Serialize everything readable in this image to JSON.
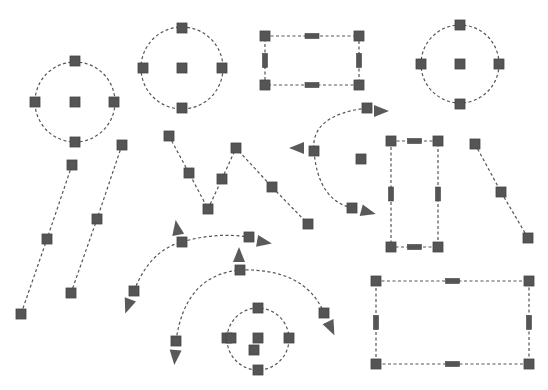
{
  "canvas": {
    "width": 548,
    "height": 390,
    "background": "#ffffff"
  },
  "colors": {
    "stroke": "#555555",
    "handle": "#555555",
    "arrow": "#5a5a5a"
  },
  "handle_size": 10,
  "circles": [
    {
      "id": "circle-left",
      "cx": 75,
      "cy": 102,
      "r": 40,
      "handles": [
        [
          75,
          61
        ],
        [
          35,
          102
        ],
        [
          114,
          102
        ],
        [
          75,
          142
        ],
        [
          75,
          102
        ]
      ]
    },
    {
      "id": "circle-top-center",
      "cx": 182,
      "cy": 68,
      "r": 41,
      "handles": [
        [
          182,
          28
        ],
        [
          143,
          68
        ],
        [
          222,
          68
        ],
        [
          182,
          108
        ],
        [
          182,
          68
        ]
      ]
    },
    {
      "id": "circle-top-right",
      "cx": 460,
      "cy": 64,
      "r": 39,
      "handles": [
        [
          460,
          25
        ],
        [
          421,
          64
        ],
        [
          499,
          64
        ],
        [
          460,
          104
        ],
        [
          460,
          64
        ]
      ]
    },
    {
      "id": "circle-small-bottom",
      "cx": 258,
      "cy": 339,
      "r": 31,
      "handles": [
        [
          258,
          308
        ],
        [
          227,
          338
        ],
        [
          231,
          338
        ],
        [
          289,
          338
        ],
        [
          258,
          370
        ],
        [
          258,
          338
        ],
        [
          254,
          350
        ]
      ]
    }
  ],
  "rects": [
    {
      "id": "rect-top",
      "x1": 265,
      "y1": 36,
      "x2": 359,
      "y2": 85
    },
    {
      "id": "rect-vertical",
      "x1": 391,
      "y1": 141,
      "x2": 438,
      "y2": 247
    },
    {
      "id": "rect-bottom-right",
      "x1": 376,
      "y1": 281,
      "x2": 529,
      "y2": 364
    }
  ],
  "polylines": [
    {
      "id": "line-left-a",
      "points": [
        [
          72,
          165
        ],
        [
          47,
          239
        ],
        [
          21,
          314
        ]
      ]
    },
    {
      "id": "line-left-b",
      "points": [
        [
          122,
          145
        ],
        [
          97,
          219
        ],
        [
          71,
          293
        ]
      ]
    },
    {
      "id": "zigzag",
      "points": [
        [
          169,
          136
        ],
        [
          189,
          173
        ],
        [
          208,
          209
        ],
        [
          222,
          179
        ],
        [
          236,
          148
        ],
        [
          272,
          187
        ],
        [
          308,
          224
        ]
      ]
    },
    {
      "id": "line-right",
      "points": [
        [
          475,
          144
        ],
        [
          501,
          192
        ],
        [
          528,
          238
        ]
      ]
    }
  ],
  "arcs": [
    {
      "id": "arc-right-middle",
      "d": "M367,108 Q310,115 314,151 Q318,200 352,208",
      "handles": [
        [
          367,
          108
        ],
        [
          314,
          151
        ],
        [
          352,
          208
        ],
        [
          361,
          159
        ]
      ],
      "arrows": [
        {
          "x": 381,
          "y": 111,
          "angle": 0
        },
        {
          "x": 297,
          "y": 148,
          "angle": 180
        },
        {
          "x": 368,
          "y": 212,
          "angle": 15
        }
      ]
    },
    {
      "id": "arc-bottom-left",
      "d": "M134,291 Q150,250 182,242 Q215,232 249,237",
      "handles": [
        [
          134,
          291
        ],
        [
          182,
          242
        ],
        [
          249,
          237
        ]
      ],
      "arrows": [
        {
          "x": 128,
          "y": 306,
          "angle": 110
        },
        {
          "x": 177,
          "y": 228,
          "angle": -100
        },
        {
          "x": 264,
          "y": 242,
          "angle": 10
        }
      ]
    },
    {
      "id": "arc-bottom-middle",
      "d": "M176,341 Q185,275 240,270 Q305,268 324,313",
      "handles": [
        [
          176,
          341
        ],
        [
          240,
          270
        ],
        [
          324,
          313
        ]
      ],
      "arrows": [
        {
          "x": 175,
          "y": 357,
          "angle": 95
        },
        {
          "x": 239,
          "y": 255,
          "angle": -90
        },
        {
          "x": 331,
          "y": 328,
          "angle": 65
        }
      ]
    }
  ]
}
